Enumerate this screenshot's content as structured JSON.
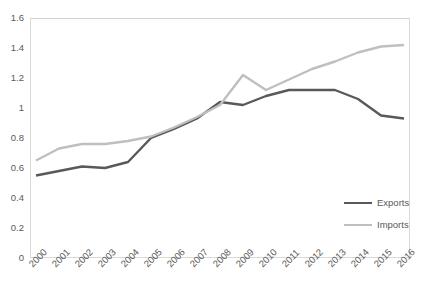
{
  "chart_data": {
    "type": "line",
    "title": "",
    "subtitle": "",
    "xlabel": "",
    "ylabel": "",
    "x": [
      "2000",
      "2001",
      "2002",
      "2003",
      "2004",
      "2005",
      "2006",
      "2007",
      "2008",
      "2009",
      "2010",
      "2011",
      "2012",
      "2013",
      "2014",
      "2015",
      "2016"
    ],
    "xlim": [
      "2000",
      "2016"
    ],
    "ylim": [
      0,
      1.6
    ],
    "yticks": [
      "0",
      "0.2",
      "0.4",
      "0.6",
      "0.8",
      "1",
      "1.2",
      "1.4",
      "1.6"
    ],
    "ytick_values": [
      0,
      0.2,
      0.4,
      0.6,
      0.8,
      1,
      1.2,
      1.4,
      1.6
    ],
    "grid": false,
    "legend_position": "bottom-right",
    "series": [
      {
        "name": "Exports",
        "color": "#595959",
        "values": [
          0.55,
          0.58,
          0.61,
          0.6,
          0.64,
          0.8,
          0.86,
          0.93,
          1.04,
          1.02,
          1.08,
          1.12,
          1.12,
          1.12,
          1.06,
          0.95,
          0.93
        ]
      },
      {
        "name": "Imports",
        "color": "#bfbfbf",
        "values": [
          0.65,
          0.73,
          0.76,
          0.76,
          0.78,
          0.81,
          0.87,
          0.94,
          1.02,
          1.22,
          1.12,
          1.19,
          1.26,
          1.31,
          1.37,
          1.41,
          1.42
        ]
      }
    ]
  },
  "legend": {
    "entries": [
      {
        "label": "Exports",
        "color": "#595959"
      },
      {
        "label": "Imports",
        "color": "#bfbfbf"
      }
    ]
  }
}
